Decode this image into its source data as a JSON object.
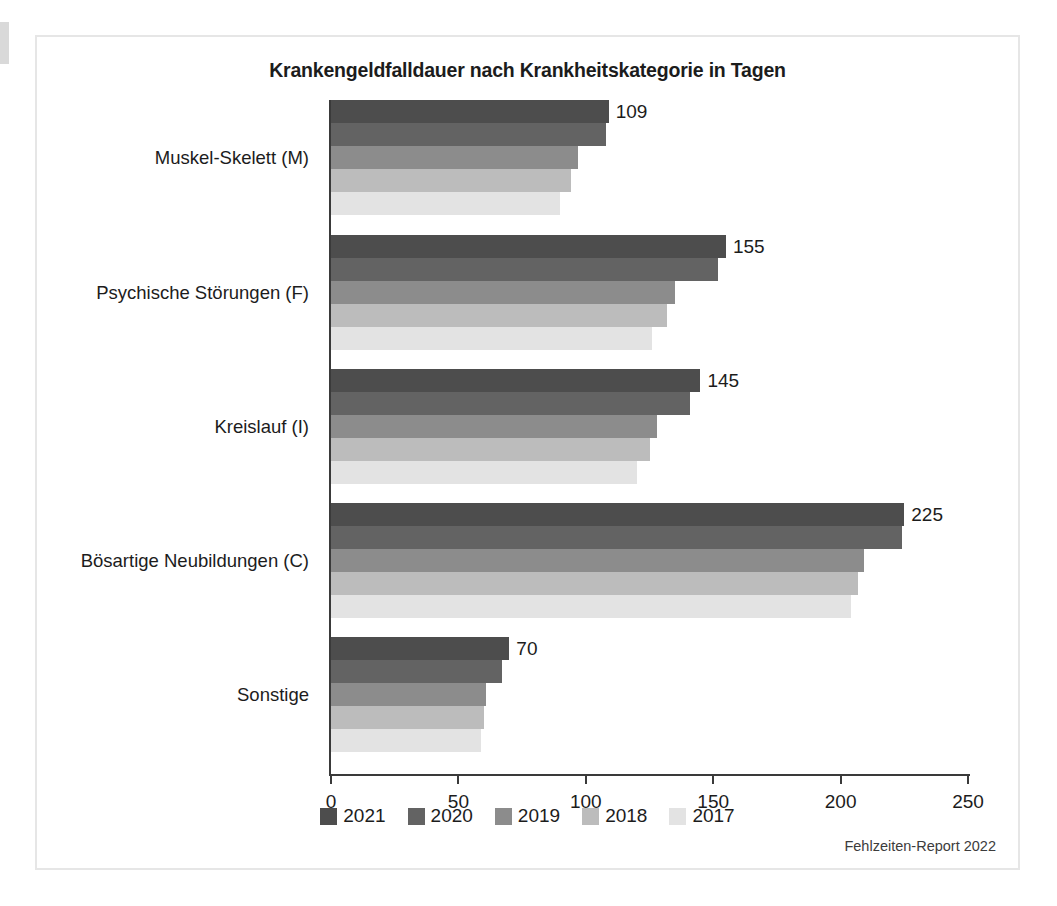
{
  "figure": {
    "title": "Krankengeldfalldauer nach Krankheitskategorie in Tagen",
    "source_note": "Fehlzeiten-Report 2022"
  },
  "chart_data": {
    "type": "bar",
    "orientation": "horizontal",
    "title": "Krankengeldfalldauer nach Krankheitskategorie in Tagen",
    "xlabel": "",
    "ylabel": "",
    "xlim": [
      0,
      250
    ],
    "xticks": [
      0,
      50,
      100,
      150,
      200,
      250
    ],
    "grid": false,
    "legend_position": "bottom",
    "categories": [
      "Muskel-Skelett (M)",
      "Psychische Störungen (F)",
      "Kreislauf (I)",
      "Bösartige Neubildungen (C)",
      "Sonstige"
    ],
    "series": [
      {
        "name": "2021",
        "color": "#4d4d4d",
        "values": [
          109,
          155,
          145,
          225,
          70
        ]
      },
      {
        "name": "2020",
        "color": "#636363",
        "values": [
          108,
          152,
          141,
          224,
          67
        ]
      },
      {
        "name": "2019",
        "color": "#8c8c8c",
        "values": [
          97,
          135,
          128,
          209,
          61
        ]
      },
      {
        "name": "2018",
        "color": "#bcbcbc",
        "values": [
          94,
          132,
          125,
          207,
          60
        ]
      },
      {
        "name": "2017",
        "color": "#e3e3e3",
        "values": [
          90,
          126,
          120,
          204,
          59
        ]
      }
    ],
    "labelled_series": "2021",
    "data_labels": [
      "109",
      "155",
      "145",
      "225",
      "70"
    ]
  }
}
